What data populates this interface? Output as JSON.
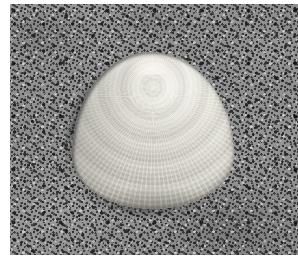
{
  "image": {
    "kind": "photograph",
    "subject": "seashell",
    "scene": "bivalve clam shell resting on coarse sand",
    "palette": "greyscale",
    "alt_text": "A pale ridged bivalve clam shell lying on coarse speckled grey sand",
    "canvas": {
      "width": 298,
      "height": 267,
      "background": "#ffffff"
    },
    "frame": {
      "left": 10,
      "top": 4,
      "width": 288,
      "height": 251
    }
  },
  "background": {
    "name": "sand",
    "description": "coarse granular sand with dark mineral speckles",
    "base_color": "#8f8f8f",
    "light_grain_color": "#d8d8d8",
    "dark_grain_color": "#1a1a1a",
    "mid_tone": "#9a9a9a"
  },
  "subject": {
    "name": "clam-shell",
    "description": "bivalve shell, apex at top, fan shaped, concentric growth rings crossed by radial ribs",
    "bounds": {
      "left": 72,
      "top": 52,
      "width": 160,
      "height": 155
    },
    "apex": {
      "x": 152,
      "y": 53
    },
    "highlight_color": "#f0efe9",
    "body_color": "#d5d2c8",
    "shade_color": "#a9a69e",
    "outline_shadow_color": "#282826",
    "surface_features": [
      "concentric growth rings",
      "radial ribs",
      "cross-hatched texture",
      "specular highlight on upper right",
      "cast shadow on lower left"
    ]
  }
}
